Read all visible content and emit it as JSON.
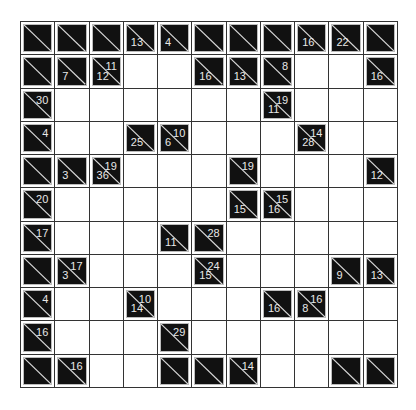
{
  "puzzle": {
    "type": "kakuro",
    "rows": 11,
    "cols": 11,
    "colors": {
      "block": "#111111",
      "empty": "#ffffff",
      "grid_line": "#333333",
      "clue_text": "#e8e8e8"
    },
    "grid": [
      [
        {
          "t": "b"
        },
        {
          "t": "b"
        },
        {
          "t": "b"
        },
        {
          "t": "b",
          "d": "13"
        },
        {
          "t": "b",
          "d": "4"
        },
        {
          "t": "b"
        },
        {
          "t": "b"
        },
        {
          "t": "b"
        },
        {
          "t": "b",
          "d": "16"
        },
        {
          "t": "b",
          "d": "22"
        },
        {
          "t": "b"
        }
      ],
      [
        {
          "t": "b"
        },
        {
          "t": "b",
          "d": "7"
        },
        {
          "t": "b",
          "d": "12",
          "r": "11"
        },
        {
          "t": "w"
        },
        {
          "t": "w"
        },
        {
          "t": "b",
          "d": "16"
        },
        {
          "t": "b",
          "d": "13"
        },
        {
          "t": "b",
          "r": "8"
        },
        {
          "t": "w"
        },
        {
          "t": "w"
        },
        {
          "t": "b",
          "d": "16"
        }
      ],
      [
        {
          "t": "b",
          "r": "30"
        },
        {
          "t": "w"
        },
        {
          "t": "w"
        },
        {
          "t": "w"
        },
        {
          "t": "w"
        },
        {
          "t": "w"
        },
        {
          "t": "w"
        },
        {
          "t": "b",
          "d": "11",
          "r": "19"
        },
        {
          "t": "w"
        },
        {
          "t": "w"
        },
        {
          "t": "w"
        }
      ],
      [
        {
          "t": "b",
          "r": "4"
        },
        {
          "t": "w"
        },
        {
          "t": "w"
        },
        {
          "t": "b",
          "d": "25"
        },
        {
          "t": "b",
          "d": "6",
          "r": "10"
        },
        {
          "t": "w"
        },
        {
          "t": "w"
        },
        {
          "t": "w"
        },
        {
          "t": "b",
          "d": "28",
          "r": "14"
        },
        {
          "t": "w"
        },
        {
          "t": "w"
        }
      ],
      [
        {
          "t": "b"
        },
        {
          "t": "b",
          "d": "3"
        },
        {
          "t": "b",
          "d": "36",
          "r": "19"
        },
        {
          "t": "w"
        },
        {
          "t": "w"
        },
        {
          "t": "w"
        },
        {
          "t": "b",
          "r": "19"
        },
        {
          "t": "w"
        },
        {
          "t": "w"
        },
        {
          "t": "w"
        },
        {
          "t": "b",
          "d": "12"
        }
      ],
      [
        {
          "t": "b",
          "r": "20"
        },
        {
          "t": "w"
        },
        {
          "t": "w"
        },
        {
          "t": "w"
        },
        {
          "t": "w"
        },
        {
          "t": "w"
        },
        {
          "t": "b",
          "d": "15"
        },
        {
          "t": "b",
          "d": "16",
          "r": "15"
        },
        {
          "t": "w"
        },
        {
          "t": "w"
        },
        {
          "t": "w"
        }
      ],
      [
        {
          "t": "b",
          "r": "17"
        },
        {
          "t": "w"
        },
        {
          "t": "w"
        },
        {
          "t": "w"
        },
        {
          "t": "b",
          "d": "11"
        },
        {
          "t": "b",
          "r": "28"
        },
        {
          "t": "w"
        },
        {
          "t": "w"
        },
        {
          "t": "w"
        },
        {
          "t": "w"
        },
        {
          "t": "w"
        }
      ],
      [
        {
          "t": "b"
        },
        {
          "t": "b",
          "d": "3",
          "r": "17"
        },
        {
          "t": "w"
        },
        {
          "t": "w"
        },
        {
          "t": "w"
        },
        {
          "t": "b",
          "d": "15",
          "r": "24"
        },
        {
          "t": "w"
        },
        {
          "t": "w"
        },
        {
          "t": "w"
        },
        {
          "t": "b",
          "d": "9"
        },
        {
          "t": "b",
          "d": "13"
        }
      ],
      [
        {
          "t": "b",
          "r": "4"
        },
        {
          "t": "w"
        },
        {
          "t": "w"
        },
        {
          "t": "b",
          "d": "14",
          "r": "10"
        },
        {
          "t": "w"
        },
        {
          "t": "w"
        },
        {
          "t": "w"
        },
        {
          "t": "b",
          "d": "16"
        },
        {
          "t": "b",
          "d": "8",
          "r": "16"
        },
        {
          "t": "w"
        },
        {
          "t": "w"
        }
      ],
      [
        {
          "t": "b",
          "r": "16"
        },
        {
          "t": "w"
        },
        {
          "t": "w"
        },
        {
          "t": "w"
        },
        {
          "t": "b",
          "r": "29"
        },
        {
          "t": "w"
        },
        {
          "t": "w"
        },
        {
          "t": "w"
        },
        {
          "t": "w"
        },
        {
          "t": "w"
        },
        {
          "t": "w"
        }
      ],
      [
        {
          "t": "b"
        },
        {
          "t": "b",
          "r": "16"
        },
        {
          "t": "w"
        },
        {
          "t": "w"
        },
        {
          "t": "b"
        },
        {
          "t": "b"
        },
        {
          "t": "b",
          "r": "14"
        },
        {
          "t": "w"
        },
        {
          "t": "w"
        },
        {
          "t": "b"
        },
        {
          "t": "b"
        }
      ]
    ]
  }
}
